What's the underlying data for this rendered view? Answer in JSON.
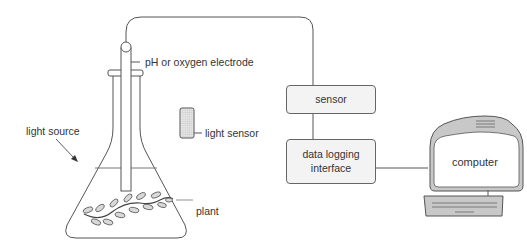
{
  "diagram": {
    "labels": {
      "electrode": "pH or oxygen electrode",
      "light_sensor": "light sensor",
      "light_source": "light source",
      "plant": "plant",
      "sensor_box": "sensor",
      "data_logging_box_line1": "data logging",
      "data_logging_box_line2": "interface",
      "computer": "computer"
    },
    "colors": {
      "stroke": "#555555",
      "box_fill": "#f3f3f3",
      "computer_body": "#c8c8c8",
      "computer_screen": "#ffffff",
      "leaf_fill": "#d9d9d9",
      "light_sensor_fill": "#e8e8e8"
    }
  }
}
